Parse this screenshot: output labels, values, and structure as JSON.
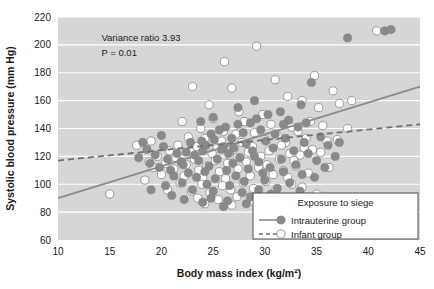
{
  "chart_data": {
    "type": "scatter",
    "title": "",
    "xlabel": "Body mass index (kg/m²)",
    "ylabel": "Systolic blood pressure (mm Hg)",
    "xlim": [
      10,
      45
    ],
    "ylim": [
      60,
      220
    ],
    "xticks": [
      10,
      15,
      20,
      25,
      30,
      35,
      40,
      45
    ],
    "yticks": [
      60,
      80,
      100,
      120,
      140,
      160,
      180,
      200,
      220
    ],
    "xtick_labels": [
      "10",
      "15",
      "20",
      "25",
      "30",
      "35",
      "40",
      "45"
    ],
    "ytick_labels": [
      "60",
      "80",
      "100",
      "120",
      "140",
      "160",
      "180",
      "200",
      "220"
    ],
    "grid": "horizontal-white",
    "plot_background": "#d6d6d6",
    "legend": {
      "position": "bottom-right",
      "title": "Exposure to siege",
      "entries": [
        {
          "label": "Intrauterine group",
          "marker": "filled-circle",
          "line": "solid",
          "color": "#8a8a8a"
        },
        {
          "label": "Infant group",
          "marker": "open-circle",
          "line": "dashed",
          "color": "#ffffff"
        }
      ]
    },
    "annotations": [
      {
        "text": "Variance ratio 3.93",
        "x": 14.2,
        "y": 203
      },
      {
        "text": "P = 0.01",
        "x": 14.2,
        "y": 192
      }
    ],
    "trend_lines": [
      {
        "name": "Intrauterine group",
        "style": "solid",
        "color": "#8a8a8a",
        "x0": 10,
        "y0": 90,
        "x1": 45,
        "y1": 170
      },
      {
        "name": "Infant group",
        "style": "dashed",
        "color": "#6e6e6e",
        "x0": 10,
        "y0": 117,
        "x1": 45,
        "y1": 143
      }
    ],
    "series": [
      {
        "name": "Intrauterine group",
        "marker": "filled-circle",
        "color": "#8a8a8a",
        "points": [
          [
            41.6,
            210
          ],
          [
            38.0,
            205
          ],
          [
            42.2,
            211
          ],
          [
            34.5,
            173
          ],
          [
            33.5,
            157
          ],
          [
            31.5,
            152
          ],
          [
            30.3,
            150
          ],
          [
            29.2,
            147
          ],
          [
            28.6,
            144
          ],
          [
            32.3,
            146
          ],
          [
            33.2,
            141
          ],
          [
            27.4,
            143
          ],
          [
            26.2,
            141
          ],
          [
            25.6,
            139
          ],
          [
            24.8,
            136
          ],
          [
            27.9,
            137
          ],
          [
            29.6,
            139
          ],
          [
            31.0,
            136
          ],
          [
            26.8,
            133
          ],
          [
            25.1,
            132
          ],
          [
            23.9,
            131
          ],
          [
            22.8,
            130
          ],
          [
            24.3,
            128
          ],
          [
            26.0,
            127
          ],
          [
            28.2,
            129
          ],
          [
            30.1,
            131
          ],
          [
            32.0,
            133
          ],
          [
            33.8,
            130
          ],
          [
            35.4,
            134
          ],
          [
            27.0,
            126
          ],
          [
            25.8,
            125
          ],
          [
            24.0,
            124
          ],
          [
            22.4,
            123
          ],
          [
            21.5,
            122
          ],
          [
            23.2,
            121
          ],
          [
            26.5,
            122
          ],
          [
            28.8,
            124
          ],
          [
            30.8,
            126
          ],
          [
            32.8,
            124
          ],
          [
            34.2,
            122
          ],
          [
            36.1,
            128
          ],
          [
            29.0,
            120
          ],
          [
            27.6,
            119
          ],
          [
            25.4,
            118
          ],
          [
            23.6,
            117
          ],
          [
            21.9,
            116
          ],
          [
            20.6,
            118
          ],
          [
            22.1,
            114
          ],
          [
            24.6,
            113
          ],
          [
            26.9,
            115
          ],
          [
            29.4,
            116
          ],
          [
            31.6,
            118
          ],
          [
            33.0,
            114
          ],
          [
            35.0,
            117
          ],
          [
            37.2,
            130
          ],
          [
            30.5,
            112
          ],
          [
            28.4,
            111
          ],
          [
            26.3,
            110
          ],
          [
            24.2,
            109
          ],
          [
            22.6,
            108
          ],
          [
            20.9,
            110
          ],
          [
            19.8,
            112
          ],
          [
            21.2,
            106
          ],
          [
            23.4,
            105
          ],
          [
            25.2,
            104
          ],
          [
            27.2,
            106
          ],
          [
            29.8,
            108
          ],
          [
            31.8,
            109
          ],
          [
            33.6,
            107
          ],
          [
            19.4,
            121
          ],
          [
            18.6,
            125
          ],
          [
            20.2,
            127
          ],
          [
            18.9,
            115
          ],
          [
            17.8,
            119
          ],
          [
            22.0,
            101
          ],
          [
            24.4,
            100
          ],
          [
            26.6,
            99
          ],
          [
            28.0,
            102
          ],
          [
            30.0,
            103
          ],
          [
            32.4,
            101
          ],
          [
            34.8,
            105
          ],
          [
            23.0,
            96
          ],
          [
            25.0,
            95
          ],
          [
            27.8,
            94
          ],
          [
            29.4,
            96
          ],
          [
            31.2,
            97
          ],
          [
            33.4,
            95
          ],
          [
            21.0,
            92
          ],
          [
            24.8,
            90
          ],
          [
            26.4,
            88
          ],
          [
            28.6,
            91
          ],
          [
            30.6,
            93
          ],
          [
            19.0,
            96
          ],
          [
            20.4,
            99
          ],
          [
            35.8,
            112
          ],
          [
            36.8,
            120
          ],
          [
            28.2,
            86
          ],
          [
            26.0,
            84
          ],
          [
            24.0,
            87
          ],
          [
            30.2,
            85
          ],
          [
            22.2,
            89
          ],
          [
            31.4,
            88
          ],
          [
            33.0,
            90
          ],
          [
            27.4,
            155
          ],
          [
            29.0,
            160
          ],
          [
            25.0,
            148
          ],
          [
            31.8,
            143
          ],
          [
            34.0,
            144
          ],
          [
            23.8,
            145
          ],
          [
            20.0,
            135
          ],
          [
            18.2,
            130
          ]
        ]
      },
      {
        "name": "Infant group",
        "marker": "open-circle",
        "color": "#ffffff",
        "points": [
          [
            29.2,
            199
          ],
          [
            26.1,
            188
          ],
          [
            40.8,
            210
          ],
          [
            23.0,
            170
          ],
          [
            26.8,
            169
          ],
          [
            31.0,
            175
          ],
          [
            34.8,
            178
          ],
          [
            22.0,
            145
          ],
          [
            24.6,
            157
          ],
          [
            32.2,
            163
          ],
          [
            33.6,
            160
          ],
          [
            36.6,
            167
          ],
          [
            35.2,
            155
          ],
          [
            27.5,
            152
          ],
          [
            29.8,
            150
          ],
          [
            25.0,
            147
          ],
          [
            28.0,
            145
          ],
          [
            30.6,
            143
          ],
          [
            32.6,
            141
          ],
          [
            34.4,
            145
          ],
          [
            37.2,
            158
          ],
          [
            38.4,
            160
          ],
          [
            23.8,
            140
          ],
          [
            26.0,
            138
          ],
          [
            27.2,
            136
          ],
          [
            29.0,
            137
          ],
          [
            31.2,
            135
          ],
          [
            33.2,
            138
          ],
          [
            35.6,
            142
          ],
          [
            22.6,
            134
          ],
          [
            24.2,
            133
          ],
          [
            25.8,
            131
          ],
          [
            27.8,
            130
          ],
          [
            30.0,
            132
          ],
          [
            32.0,
            130
          ],
          [
            34.0,
            133
          ],
          [
            21.6,
            128
          ],
          [
            23.4,
            127
          ],
          [
            25.4,
            126
          ],
          [
            27.0,
            125
          ],
          [
            28.8,
            127
          ],
          [
            31.6,
            128
          ],
          [
            33.8,
            126
          ],
          [
            36.0,
            131
          ],
          [
            20.8,
            124
          ],
          [
            22.8,
            123
          ],
          [
            24.9,
            122
          ],
          [
            26.6,
            121
          ],
          [
            28.4,
            123
          ],
          [
            30.4,
            124
          ],
          [
            32.4,
            122
          ],
          [
            34.6,
            125
          ],
          [
            19.6,
            120
          ],
          [
            21.4,
            119
          ],
          [
            23.2,
            118
          ],
          [
            25.2,
            117
          ],
          [
            27.6,
            119
          ],
          [
            29.6,
            120
          ],
          [
            31.4,
            118
          ],
          [
            33.4,
            121
          ],
          [
            35.4,
            123
          ],
          [
            18.8,
            116
          ],
          [
            20.4,
            115
          ],
          [
            22.4,
            114
          ],
          [
            24.4,
            113
          ],
          [
            26.4,
            115
          ],
          [
            28.2,
            116
          ],
          [
            30.2,
            114
          ],
          [
            32.8,
            117
          ],
          [
            37.0,
            132
          ],
          [
            19.2,
            112
          ],
          [
            21.2,
            111
          ],
          [
            23.6,
            110
          ],
          [
            25.6,
            109
          ],
          [
            27.4,
            111
          ],
          [
            29.4,
            112
          ],
          [
            31.8,
            110
          ],
          [
            33.0,
            113
          ],
          [
            20.0,
            107
          ],
          [
            22.2,
            106
          ],
          [
            24.0,
            105
          ],
          [
            26.2,
            104
          ],
          [
            28.6,
            106
          ],
          [
            30.8,
            107
          ],
          [
            32.2,
            105
          ],
          [
            34.2,
            108
          ],
          [
            18.4,
            103
          ],
          [
            21.8,
            101
          ],
          [
            23.9,
            100
          ],
          [
            25.9,
            99
          ],
          [
            27.9,
            101
          ],
          [
            30.1,
            102
          ],
          [
            32.6,
            100
          ],
          [
            15.0,
            93
          ],
          [
            20.6,
            96
          ],
          [
            22.9,
            95
          ],
          [
            24.7,
            94
          ],
          [
            26.7,
            96
          ],
          [
            28.9,
            97
          ],
          [
            31.0,
            95
          ],
          [
            33.6,
            98
          ],
          [
            23.5,
            90
          ],
          [
            25.5,
            89
          ],
          [
            27.3,
            91
          ],
          [
            29.2,
            92
          ],
          [
            31.4,
            90
          ],
          [
            35.0,
            93
          ],
          [
            24.2,
            86
          ],
          [
            26.8,
            85
          ],
          [
            29.0,
            87
          ],
          [
            36.2,
            112
          ],
          [
            38.0,
            140
          ],
          [
            17.6,
            128
          ],
          [
            19.0,
            131
          ]
        ]
      }
    ]
  }
}
